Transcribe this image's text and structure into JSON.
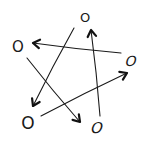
{
  "diagram": {
    "type": "directed-graph",
    "style": "hand-drawn",
    "background": "#ffffff",
    "ink_color": "#1a1a1a",
    "nodes": [
      {
        "id": "top",
        "label": "O",
        "x": 85,
        "y": 17,
        "size": 13,
        "skew": 0
      },
      {
        "id": "left",
        "label": "O",
        "x": 18,
        "y": 47,
        "size": 15,
        "skew": 0
      },
      {
        "id": "right",
        "label": "O",
        "x": 131,
        "y": 61,
        "size": 14,
        "skew": -15
      },
      {
        "id": "bottom-left",
        "label": "O",
        "x": 28,
        "y": 123,
        "size": 17,
        "skew": 0
      },
      {
        "id": "bottom-right",
        "label": "O",
        "x": 97,
        "y": 128,
        "size": 15,
        "skew": -15
      }
    ],
    "edges": [
      {
        "from": "top",
        "to": "bottom-left",
        "x1": 74,
        "y1": 28,
        "x2": 33,
        "y2": 106
      },
      {
        "from": "right",
        "to": "left",
        "x1": 121,
        "y1": 53,
        "x2": 33,
        "y2": 43
      },
      {
        "from": "left",
        "to": "bottom-right",
        "x1": 27,
        "y1": 58,
        "x2": 80,
        "y2": 122
      },
      {
        "from": "bottom-left",
        "to": "right",
        "x1": 41,
        "y1": 116,
        "x2": 127,
        "y2": 73
      },
      {
        "from": "bottom-right",
        "to": "top",
        "x1": 100,
        "y1": 116,
        "x2": 91,
        "y2": 30
      }
    ]
  }
}
